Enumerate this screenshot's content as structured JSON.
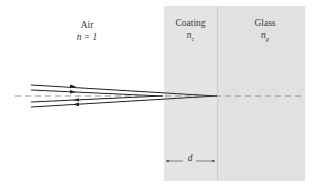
{
  "regions": {
    "air": {
      "label": "Air",
      "index_label": "n = 1"
    },
    "coating": {
      "label": "Coating",
      "index_symbol": "n",
      "index_subscript": "c",
      "fill": "#e3e3e3"
    },
    "glass": {
      "label": "Glass",
      "index_symbol": "n",
      "index_subscript": "g",
      "fill": "#e3e3e3"
    }
  },
  "dimension": {
    "label": "d"
  },
  "colors": {
    "ray": "#222222",
    "axis_dash": "#777777",
    "boundary": "#bdbdbd"
  }
}
